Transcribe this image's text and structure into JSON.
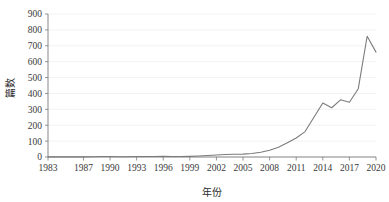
{
  "chart_data": {
    "type": "line",
    "title": "",
    "xlabel": "年份",
    "ylabel": "篇数",
    "grid": true,
    "legend": false,
    "xlim": [
      1983,
      2020
    ],
    "ylim": [
      0,
      900
    ],
    "x_tick_labels": [
      "1983",
      "1987",
      "1990",
      "1993",
      "1996",
      "1999",
      "2002",
      "2005",
      "2008",
      "2011",
      "2014",
      "2017",
      "2020"
    ],
    "y_tick_labels": [
      "0",
      "100",
      "200",
      "300",
      "400",
      "500",
      "600",
      "700",
      "800",
      "900"
    ],
    "y_ticks": [
      0,
      100,
      200,
      300,
      400,
      500,
      600,
      700,
      800,
      900
    ],
    "x": [
      1983,
      1984,
      1985,
      1986,
      1987,
      1988,
      1989,
      1990,
      1991,
      1992,
      1993,
      1994,
      1995,
      1996,
      1997,
      1998,
      1999,
      2000,
      2001,
      2002,
      2003,
      2004,
      2005,
      2006,
      2007,
      2008,
      2009,
      2010,
      2011,
      2012,
      2013,
      2014,
      2015,
      2016,
      2017,
      2018,
      2019,
      2020
    ],
    "series": [
      {
        "name": "篇数",
        "color": "#7b7b7b",
        "values": [
          1,
          1,
          1,
          1,
          1,
          2,
          3,
          3,
          2,
          2,
          3,
          3,
          3,
          4,
          3,
          3,
          4,
          6,
          9,
          13,
          16,
          17,
          18,
          22,
          30,
          42,
          62,
          90,
          120,
          160,
          250,
          340,
          310,
          360,
          345,
          430,
          760,
          660
        ]
      }
    ]
  },
  "axis": {
    "ylabel": "篇数",
    "xlabel": "年份"
  }
}
